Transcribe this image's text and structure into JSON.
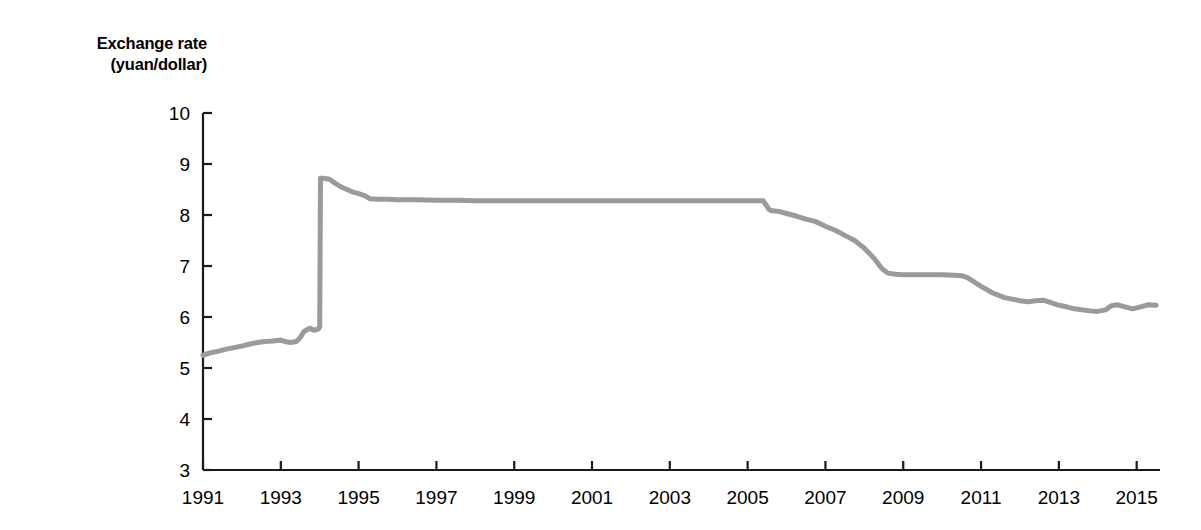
{
  "chart_data": {
    "type": "line",
    "title": "",
    "ylabel": "Exchange rate (yuan/dollar)",
    "ylabel_line1": "Exchange rate",
    "ylabel_line2": "(yuan/dollar)",
    "xlabel": "",
    "xlim": [
      1991,
      2015.6
    ],
    "ylim": [
      3,
      10
    ],
    "yticks": [
      3,
      4,
      5,
      6,
      7,
      8,
      9,
      10
    ],
    "xticks": [
      1991,
      1993,
      1995,
      1997,
      1999,
      2001,
      2003,
      2005,
      2007,
      2009,
      2011,
      2013,
      2015
    ],
    "grid": false,
    "legend": "none",
    "series": [
      {
        "name": "Exchange rate (yuan/dollar)",
        "color": "#9a9a9a",
        "x": [
          1991.0,
          1991.2,
          1991.4,
          1991.6,
          1991.8,
          1992.0,
          1992.2,
          1992.4,
          1992.6,
          1992.8,
          1993.0,
          1993.1,
          1993.25,
          1993.4,
          1993.5,
          1993.6,
          1993.75,
          1993.85,
          1993.95,
          1994.0,
          1994.02,
          1994.12,
          1994.25,
          1994.4,
          1994.55,
          1994.7,
          1994.85,
          1995.0,
          1995.15,
          1995.3,
          1995.5,
          1995.75,
          1996.0,
          1996.5,
          1997.0,
          1997.5,
          1998.0,
          1998.5,
          1999.0,
          1999.5,
          2000.0,
          2000.5,
          2001.0,
          2001.5,
          2002.0,
          2002.5,
          2003.0,
          2003.5,
          2004.0,
          2004.5,
          2005.0,
          2005.4,
          2005.55,
          2005.6,
          2005.8,
          2006.0,
          2006.25,
          2006.5,
          2006.75,
          2007.0,
          2007.25,
          2007.5,
          2007.75,
          2008.0,
          2008.25,
          2008.45,
          2008.6,
          2008.8,
          2009.0,
          2009.3,
          2009.6,
          2010.0,
          2010.3,
          2010.5,
          2010.65,
          2010.8,
          2011.0,
          2011.3,
          2011.6,
          2012.0,
          2012.2,
          2012.4,
          2012.6,
          2012.8,
          2013.0,
          2013.2,
          2013.4,
          2013.6,
          2013.8,
          2014.0,
          2014.2,
          2014.35,
          2014.5,
          2014.7,
          2014.9,
          2015.1,
          2015.3,
          2015.5
        ],
        "y": [
          5.25,
          5.3,
          5.33,
          5.37,
          5.4,
          5.43,
          5.47,
          5.5,
          5.52,
          5.53,
          5.55,
          5.52,
          5.5,
          5.52,
          5.6,
          5.72,
          5.78,
          5.74,
          5.76,
          5.8,
          8.72,
          8.72,
          8.7,
          8.62,
          8.55,
          8.5,
          8.45,
          8.42,
          8.38,
          8.32,
          8.31,
          8.31,
          8.3,
          8.3,
          8.29,
          8.29,
          8.28,
          8.28,
          8.28,
          8.28,
          8.28,
          8.28,
          8.28,
          8.28,
          8.28,
          8.28,
          8.28,
          8.28,
          8.28,
          8.28,
          8.28,
          8.28,
          8.11,
          8.09,
          8.07,
          8.03,
          7.98,
          7.92,
          7.87,
          7.78,
          7.7,
          7.6,
          7.5,
          7.35,
          7.15,
          6.95,
          6.86,
          6.84,
          6.83,
          6.83,
          6.83,
          6.83,
          6.82,
          6.81,
          6.77,
          6.7,
          6.6,
          6.47,
          6.38,
          6.32,
          6.3,
          6.32,
          6.33,
          6.28,
          6.23,
          6.2,
          6.16,
          6.14,
          6.12,
          6.11,
          6.14,
          6.22,
          6.24,
          6.2,
          6.16,
          6.2,
          6.24,
          6.23
        ],
        "annotations": [
          {
            "label": "gradual depreciation",
            "range": [
              1991,
              1993.95
            ],
            "values": [
              5.25,
              5.8
            ]
          },
          {
            "label": "1994 devaluation",
            "at": 1994.02,
            "value": 8.72
          },
          {
            "label": "peg at ~8.28",
            "range": [
              1997,
              2005.4
            ],
            "value": 8.28
          },
          {
            "label": "2005 revaluation break",
            "at": 2005.55,
            "value": 8.11
          },
          {
            "label": "re-peg at ~6.83",
            "range": [
              2008.8,
              2010.3
            ],
            "value": 6.83
          },
          {
            "label": "end of series",
            "at": 2015.5,
            "value": 6.23
          }
        ]
      }
    ]
  },
  "axes": {
    "line_color": "#1a1a1a",
    "tick_color": "#1a1a1a"
  }
}
